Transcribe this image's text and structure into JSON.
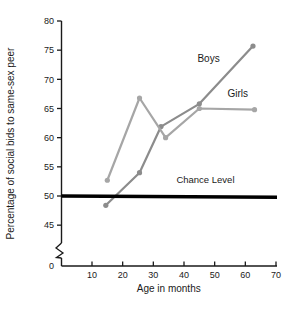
{
  "chart_data": {
    "type": "line",
    "title": "",
    "xlabel": "Age in months",
    "ylabel": "Percentage of social bids to same-sex peer",
    "xlim": [
      0,
      70
    ],
    "ylim": [
      43,
      80
    ],
    "y_axis_break": true,
    "y_break_between": [
      0,
      43
    ],
    "grid": false,
    "legend_position": "inline-annotations",
    "xticks": [
      0,
      10,
      20,
      30,
      40,
      50,
      60,
      70
    ],
    "xtick_labels": [
      "0",
      "10",
      "20",
      "30",
      "40",
      "50",
      "60",
      "70"
    ],
    "yticks": [
      45,
      50,
      55,
      60,
      65,
      70,
      75,
      80
    ],
    "ytick_labels": [
      "45",
      "50",
      "55",
      "60",
      "65",
      "70",
      "75",
      "80"
    ],
    "y_zero_tick_label": "0",
    "series": [
      {
        "name": "Boys",
        "color": "#8c8c8c",
        "x": [
          14.5,
          25.5,
          32.5,
          45.0,
          62.5
        ],
        "values": [
          48.4,
          54.0,
          61.9,
          65.8,
          75.7
        ]
      },
      {
        "name": "Girls",
        "color": "#a6a6a6",
        "x": [
          15.0,
          25.5,
          34.0,
          45.0,
          63.0
        ],
        "values": [
          52.7,
          66.8,
          60.0,
          65.0,
          64.8
        ]
      }
    ],
    "reference_line": {
      "label": "Chance Level",
      "value": 50,
      "color": "#000000"
    },
    "annotations": [
      {
        "text": "Boys",
        "x": 48.0,
        "y": 73.0
      },
      {
        "text": "Girls",
        "x": 57.5,
        "y": 67.0
      },
      {
        "text": "Chance Level",
        "x": 47.0,
        "y": 52.2
      }
    ]
  },
  "axis": {
    "x_title": "Age in months",
    "y_title": "Percentage of social bids to same-sex peer"
  },
  "colors": {
    "boys": "#8c8c8c",
    "girls": "#a6a6a6",
    "chance": "#000000",
    "axis": "#1a1a1a",
    "background": "#ffffff"
  }
}
